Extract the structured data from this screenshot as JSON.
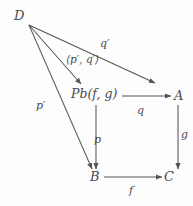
{
  "diagram": {
    "type": "commutative-diagram",
    "canvas": {
      "width": 193,
      "height": 206
    },
    "colors": {
      "background": "#fdfdfd",
      "stroke": "#555555",
      "text": "#4a4a4a"
    },
    "nodes": [
      {
        "id": "D",
        "label": "D",
        "x": 19,
        "y": 16
      },
      {
        "id": "Pb",
        "label": "Pb(f, g)",
        "x": 95,
        "y": 96
      },
      {
        "id": "A",
        "label": "A",
        "x": 179,
        "y": 96
      },
      {
        "id": "B",
        "label": "B",
        "x": 95,
        "y": 177
      },
      {
        "id": "C",
        "label": "C",
        "x": 169,
        "y": 177
      }
    ],
    "edges": [
      {
        "id": "edge-d-a",
        "from": "D",
        "to": "A",
        "label": "q′",
        "label_x": 106,
        "label_y": 45
      },
      {
        "id": "edge-d-pb",
        "from": "D",
        "to": "Pb",
        "label": "⟨p′, q′⟩",
        "label_x": 88,
        "label_y": 61
      },
      {
        "id": "edge-d-b",
        "from": "D",
        "to": "B",
        "label": "p′",
        "label_x": 42,
        "label_y": 106
      },
      {
        "id": "edge-pb-a",
        "from": "Pb",
        "to": "A",
        "label": "q",
        "label_x": 140,
        "label_y": 111
      },
      {
        "id": "edge-pb-b",
        "from": "Pb",
        "to": "B",
        "label": "p",
        "label_x": 97,
        "label_y": 140
      },
      {
        "id": "edge-a-c",
        "from": "A",
        "to": "C",
        "label": "g",
        "label_x": 184,
        "label_y": 135
      },
      {
        "id": "edge-b-c",
        "from": "B",
        "to": "C",
        "label": "f",
        "label_x": 132,
        "label_y": 191
      }
    ]
  }
}
